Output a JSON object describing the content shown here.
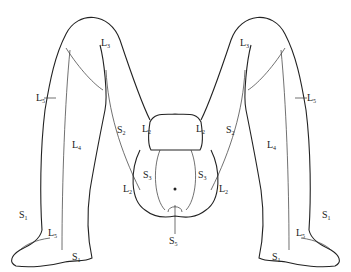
{
  "diagram": {
    "stroke_color": "#222222",
    "background": "#ffffff",
    "labels": [
      {
        "id": "left-L3",
        "letter": "L",
        "sub": "3",
        "x": 101,
        "y": 43
      },
      {
        "id": "left-L5-outer",
        "letter": "L",
        "sub": "5",
        "x": 36,
        "y": 94
      },
      {
        "id": "left-L4",
        "letter": "L",
        "sub": "4",
        "x": 72,
        "y": 142
      },
      {
        "id": "left-S2",
        "letter": "S",
        "sub": "2",
        "x": 117,
        "y": 120
      },
      {
        "id": "left-L2-upper",
        "letter": "L",
        "sub": "2",
        "x": 143,
        "y": 124
      },
      {
        "id": "left-S3",
        "letter": "S",
        "sub": "3",
        "x": 143,
        "y": 171
      },
      {
        "id": "left-L2-lower",
        "letter": "L",
        "sub": "2",
        "x": 124,
        "y": 186
      },
      {
        "id": "left-S1-toe",
        "letter": "S",
        "sub": "1",
        "x": 19,
        "y": 211
      },
      {
        "id": "left-L5-foot",
        "letter": "L",
        "sub": "5",
        "x": 48,
        "y": 228
      },
      {
        "id": "left-S1-heel",
        "letter": "S",
        "sub": "1",
        "x": 72,
        "y": 253
      },
      {
        "id": "right-L3",
        "letter": "L",
        "sub": "3",
        "x": 240,
        "y": 43
      },
      {
        "id": "right-L5-outer",
        "letter": "L",
        "sub": "5",
        "x": 305,
        "y": 94
      },
      {
        "id": "right-L4",
        "letter": "L",
        "sub": "4",
        "x": 267,
        "y": 142
      },
      {
        "id": "right-S2",
        "letter": "S",
        "sub": "2",
        "x": 226,
        "y": 120
      },
      {
        "id": "right-L2-upper",
        "letter": "L",
        "sub": "2",
        "x": 196,
        "y": 124
      },
      {
        "id": "right-S3",
        "letter": "S",
        "sub": "3",
        "x": 198,
        "y": 171
      },
      {
        "id": "right-L2-lower",
        "letter": "L",
        "sub": "2",
        "x": 219,
        "y": 186
      },
      {
        "id": "right-S1-toe",
        "letter": "S",
        "sub": "1",
        "x": 322,
        "y": 211
      },
      {
        "id": "right-L5-foot",
        "letter": "L",
        "sub": "5",
        "x": 296,
        "y": 228
      },
      {
        "id": "right-S1-heel",
        "letter": "S",
        "sub": "1",
        "x": 272,
        "y": 253
      },
      {
        "id": "center-S5",
        "letter": "S",
        "sub": "5",
        "x": 167,
        "y": 238
      }
    ]
  }
}
